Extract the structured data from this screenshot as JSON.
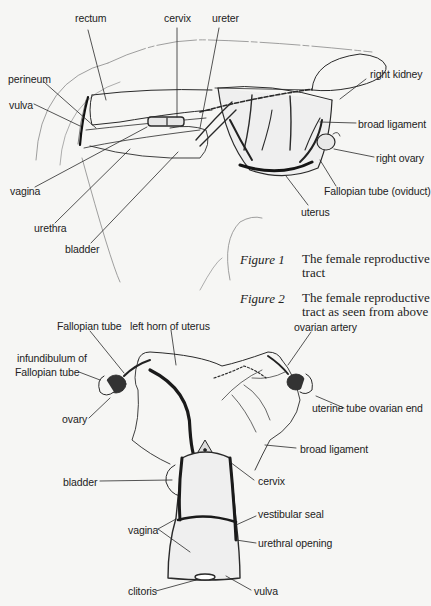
{
  "figure1": {
    "caption_number": "Figure 1",
    "caption_text": "The female reproductive tract",
    "labels": {
      "rectum": "rectum",
      "cervix": "cervix",
      "ureter": "ureter",
      "perineum": "perineum",
      "vulva": "vulva",
      "vagina": "vagina",
      "urethra": "urethra",
      "bladder": "bladder",
      "right_kidney": "right kidney",
      "broad_ligament": "broad ligament",
      "right_ovary": "right ovary",
      "fallopian_tube": "Fallopian tube (oviduct)",
      "uterus": "uterus"
    }
  },
  "figure2": {
    "caption_number": "Figure 2",
    "caption_text": "The female reproductive tract as seen from above",
    "labels": {
      "fallopian_tube": "Fallopian tube",
      "left_horn": "left horn of uterus",
      "ovarian_artery": "ovarian artery",
      "infundibulum_line1": "infundibulum of",
      "infundibulum_line2": "Fallopian tube",
      "ovary": "ovary",
      "uterine_tube_end": "uterine tube ovarian end",
      "broad_ligament": "broad ligament",
      "bladder": "bladder",
      "cervix": "cervix",
      "vestibular_seal": "vestibular seal",
      "vagina": "vagina",
      "urethral_opening": "urethral opening",
      "clitoris": "clitoris",
      "vulva": "vulva"
    }
  }
}
